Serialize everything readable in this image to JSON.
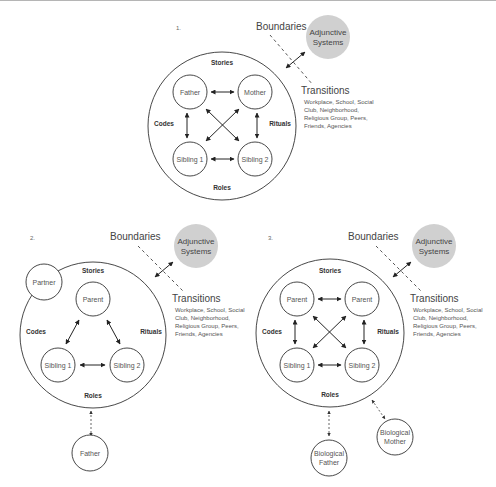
{
  "panels": [
    {
      "number": "1.",
      "themes": {
        "top": "Stories",
        "left": "Codes",
        "right": "Rituals",
        "bottom": "Roles"
      },
      "members": [
        "Father",
        "Mother",
        "Sibling 1",
        "Sibling 2"
      ],
      "external": [],
      "boundaries_label": "Boundaries",
      "adjunctive": [
        "Adjunctive",
        "Systems"
      ],
      "transitions_title": "Transitions",
      "transitions_lines": [
        "Workplace, School, Social",
        "Club, Neighborhood,",
        "Religious Group, Peers,",
        "Friends, Agencies"
      ]
    },
    {
      "number": "2.",
      "themes": {
        "top": "Stories",
        "left": "Codes",
        "right": "Rituals",
        "bottom": "Roles"
      },
      "members": [
        "Parent",
        "Sibling 1",
        "Sibling 2"
      ],
      "external": [
        "Partner",
        "Father"
      ],
      "boundaries_label": "Boundaries",
      "adjunctive": [
        "Adjunctive",
        "Systems"
      ],
      "transitions_title": "Transitions",
      "transitions_lines": [
        "Workplace, School, Social",
        "Club, Neighborhood,",
        "Religious Group, Peers,",
        "Friends, Agencies"
      ]
    },
    {
      "number": "3.",
      "themes": {
        "top": "Stories",
        "left": "Codes",
        "right": "Rituals",
        "bottom": "Roles"
      },
      "members": [
        "Parent",
        "Parent",
        "Sibling 1",
        "Sibling 2"
      ],
      "external": [
        [
          "Biological",
          "Father"
        ],
        [
          "Biological",
          "Mother"
        ]
      ],
      "boundaries_label": "Boundaries",
      "adjunctive": [
        "Adjunctive",
        "Systems"
      ],
      "transitions_title": "Transitions",
      "transitions_lines": [
        "Workplace, School, Social",
        "Club, Neighborhood,",
        "Religious Group, Peers,",
        "Friends, Agencies"
      ]
    }
  ],
  "colors": {
    "line": "#333333",
    "adjunctive_fill": "#d0d0d0",
    "text": "#555555"
  }
}
